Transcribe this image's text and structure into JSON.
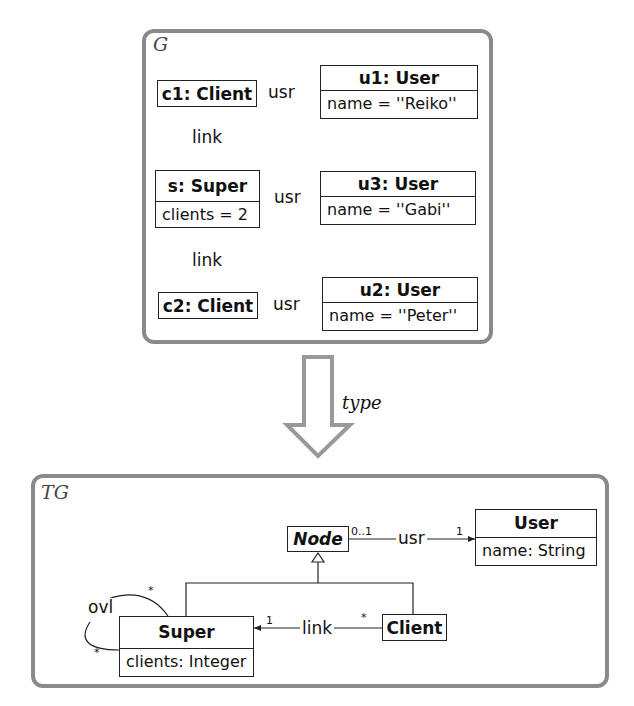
{
  "instance_graph": {
    "label": "G",
    "nodes": {
      "c1": {
        "title": "c1: Client"
      },
      "u1": {
        "title": "u1: User",
        "attr": "name = ''Reiko''"
      },
      "s": {
        "title": "s: Super",
        "attr": "clients = 2"
      },
      "u3": {
        "title": "u3: User",
        "attr": "name = ''Gabi''"
      },
      "c2": {
        "title": "c2: Client"
      },
      "u2": {
        "title": "u2: User",
        "attr": "name = ''Peter''"
      }
    },
    "edges": {
      "c1_u1": "usr",
      "c1_s": "link",
      "s_u3": "usr",
      "c2_s": "link",
      "c2_u2": "usr"
    }
  },
  "arrow": {
    "label": "type"
  },
  "type_graph": {
    "label": "TG",
    "nodes": {
      "node": {
        "title": "Node"
      },
      "user": {
        "title": "User",
        "attr": "name: String"
      },
      "super": {
        "title": "Super",
        "attr": "clients: Integer"
      },
      "client": {
        "title": "Client"
      }
    },
    "edges": {
      "usr": {
        "label": "usr",
        "source_mult": "0..1",
        "target_mult": "1"
      },
      "link": {
        "label": "link",
        "source_mult": "*",
        "target_mult": "1"
      },
      "ovl": {
        "label": "ovl",
        "source_mult": "*",
        "target_mult": "*"
      }
    }
  },
  "colors": {
    "frame": "#8a8a8a",
    "line": "#222222"
  }
}
